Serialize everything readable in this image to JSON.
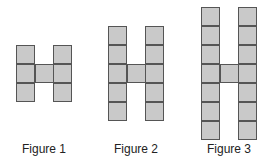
{
  "diagram": {
    "type": "pattern-sequence",
    "cell_size": 19,
    "colors": {
      "fill": "#c9c9c9",
      "stroke": "#555555",
      "background": "#ffffff"
    },
    "figures": [
      {
        "label": "Figure 1",
        "label_x": 14,
        "columns": [
          16,
          53
        ],
        "column_height": 3,
        "top": 45,
        "crossbar": {
          "x": 35,
          "y": 64
        }
      },
      {
        "label": "Figure 2",
        "label_x": 106,
        "columns": [
          108,
          145
        ],
        "column_height": 5,
        "top": 26,
        "crossbar": {
          "x": 127,
          "y": 64
        }
      },
      {
        "label": "Figure 3",
        "label_x": 199,
        "columns": [
          201,
          238
        ],
        "column_height": 7,
        "top": 7,
        "crossbar": {
          "x": 220,
          "y": 64
        }
      }
    ]
  }
}
